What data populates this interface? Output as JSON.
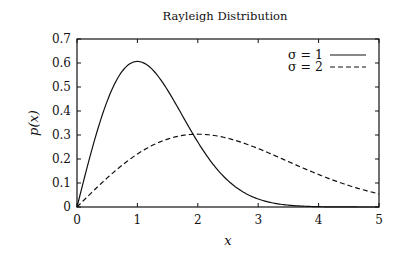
{
  "chart_data": {
    "type": "line",
    "title": "Rayleigh Distribution",
    "xlabel": "x",
    "ylabel": "p(x)",
    "xlim": [
      0,
      5
    ],
    "ylim": [
      0,
      0.7
    ],
    "x_ticks": [
      "0",
      "1",
      "2",
      "3",
      "4",
      "5"
    ],
    "y_ticks": [
      "0",
      "0.1",
      "0.2",
      "0.3",
      "0.4",
      "0.5",
      "0.6",
      "0.7"
    ],
    "grid": false,
    "legend_position": "upper right",
    "series": [
      {
        "name": "σ = 1",
        "style": "solid",
        "sigma": 1,
        "x": [
          0,
          0.5,
          1.0,
          1.5,
          2.0,
          2.5,
          3.0,
          3.5,
          4.0,
          4.5,
          5.0
        ],
        "values": [
          0,
          0.441,
          0.607,
          0.487,
          0.271,
          0.11,
          0.033,
          0.008,
          0.001,
          0.0,
          0.0
        ]
      },
      {
        "name": "σ = 2",
        "style": "dashed",
        "sigma": 2,
        "x": [
          0,
          0.5,
          1.0,
          1.5,
          2.0,
          2.5,
          3.0,
          3.5,
          4.0,
          4.5,
          5.0
        ],
        "values": [
          0,
          0.121,
          0.221,
          0.284,
          0.303,
          0.286,
          0.243,
          0.19,
          0.135,
          0.09,
          0.055
        ]
      }
    ]
  },
  "legend": {
    "items": [
      {
        "label": "σ = 1",
        "style": "solid"
      },
      {
        "label": "σ = 2",
        "style": "dashed"
      }
    ]
  }
}
